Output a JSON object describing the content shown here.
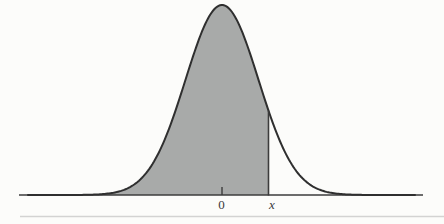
{
  "chart_data": {
    "type": "area",
    "curve": "normal-distribution-pdf",
    "title": "",
    "xlabel": "",
    "ylabel": "",
    "tick_labels": [
      "0",
      "x"
    ],
    "zero_label": "0",
    "x_label": "x",
    "shaded_region": "area under curve from left tail to vertical marker line at x (cumulative probability P(X <= x))",
    "x_position_in_sigma": 1.26,
    "axes": {
      "grid": false,
      "y_axis_shown": false,
      "x_axis_shown": true
    },
    "legend": "none",
    "geometry": {
      "width": 444,
      "height": 224,
      "center_x": 222,
      "sigma_px": 36.5,
      "peak_y": 5,
      "baseline_y": 195,
      "axis_x_start": 19,
      "axis_x_end": 423,
      "curve_x_start": 28,
      "curve_x_end": 416,
      "marker_x": 268.5,
      "tick_y_top": 187,
      "label_y": 208.5,
      "zero_label_x": 221.5,
      "x_label_x": 272,
      "rule_y": 216.5,
      "rule_x_start": 20,
      "rule_x_end": 444
    },
    "colors": {
      "background": "#fcfcfa",
      "fill": "#a8aaa9",
      "curve": "#2f2f2f",
      "axis": "#3c3c3c",
      "marker": "#3c3c3c",
      "label": "#3a3a3a",
      "rule": "#d3d3d2"
    }
  }
}
